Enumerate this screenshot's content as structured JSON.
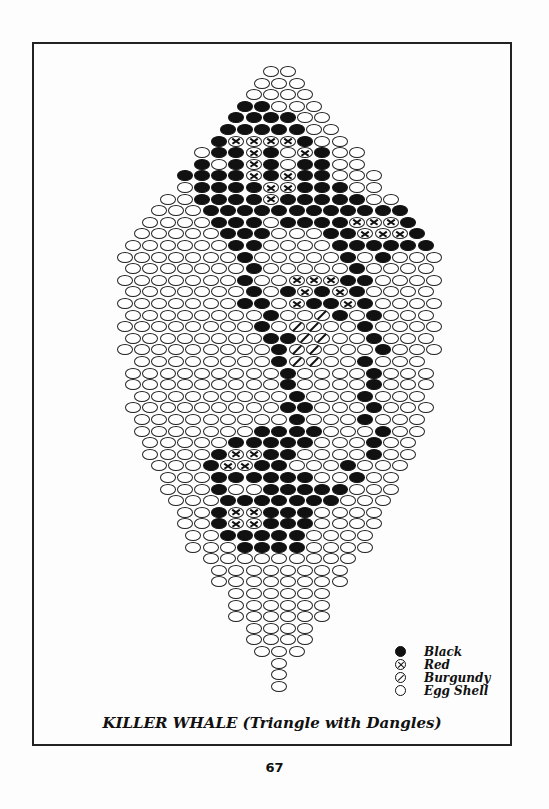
{
  "title": "KILLER WHALE (Triangle with Dangles)",
  "page_number": "67",
  "legend": [
    {
      "code": "B",
      "label": "Black",
      "icon": "filled-circle-icon",
      "color": "#111111"
    },
    {
      "code": "R",
      "label": "Red",
      "icon": "circle-x-icon",
      "color": "#ffffff"
    },
    {
      "code": "G",
      "label": "Burgundy",
      "icon": "circle-slash-icon",
      "color": "#ffffff"
    },
    {
      "code": "E",
      "label": "Egg Shell",
      "icon": "empty-circle-icon",
      "color": "#ffffff"
    }
  ],
  "pattern": {
    "bead_width": 17.2,
    "row_height": 11.6,
    "top_y": 66,
    "center_x": 280,
    "rows": [
      "EE",
      "EEE",
      "EEEE",
      "BBEEE",
      "BBBBEE",
      "BBBBBEE",
      "BRRRRBEE",
      "EBBRBERBEE",
      "BEBRBEBBEE",
      "BBBBRBRBBEEE",
      "EBBBBRRBBBEE",
      "EEBBBBRBBBBBEE",
      "EEEBBBBBBBBBBBB",
      "EEEEBBBEBBBBRRRB",
      "EEEEEBBBEEEBBRRRB",
      "EEEEEEBBEEEEBBBBBB",
      "EEEEEEEBEEEEEBEBEEE",
      "EEEEEEEBEEEEEBEEEE",
      "EEEEEEEBEERRRBBEEEE",
      "EEEEEEEBEBRBRBEEEE",
      "EEEEEEEBBERBBRBEEEE",
      "EEEEEEEEBEEGBEBEEE",
      "EEEEEEEEBEGGEEBEEEE",
      "EEEEEEEEBBGGEEBEEE",
      "EEEEEEEEEBGGEEEBEEE",
      "EEEEEEEEBGGEEBEEE",
      "EEEEEEEEEBEEEEBEEE",
      "EEEEEEEEEBEEEEBEEE",
      "EEEEEEEEEBEEEBEEE",
      "EEEEEEEEEBBEEEBEEE",
      "EEEEEEEEEBEEEBEEE",
      "EEEEEEEBBBBEEEBEE",
      "EEEEEBBBBBEEEBEE",
      "EEEEBRRBBEEEEBEE",
      "EEEBRRBBEEEBEEE",
      "EEEBBBBBBEEBEE",
      "EEEBEEBBBBBEEE",
      "EEEBBBBBBBEEE",
      "EEBRRBBBEEEE",
      "EEBRRBBBEEEE",
      "EEBBBBBEEEE",
      "EEEBBBBEEEE",
      "EEEEEEEEE",
      "EEEEEEEE",
      "EEEEEEEE",
      "EEEEEE",
      "EEEEEE",
      "EEEEEE",
      "EEEE",
      "EEEE",
      "EEE",
      "E",
      "E",
      "E"
    ]
  }
}
